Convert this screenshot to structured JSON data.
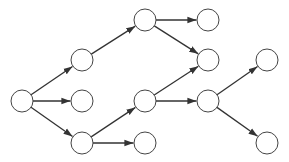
{
  "diagram": {
    "type": "directed-tree-graph",
    "node_radius": 11,
    "colors": {
      "node_fill": "#ffffff",
      "node_stroke": "#444444",
      "edge": "#333333",
      "background": "#ffffff"
    },
    "nodes": [
      {
        "id": "A",
        "x": 22,
        "y": 101
      },
      {
        "id": "B",
        "x": 82,
        "y": 60
      },
      {
        "id": "C",
        "x": 82,
        "y": 101
      },
      {
        "id": "D",
        "x": 82,
        "y": 143
      },
      {
        "id": "E",
        "x": 145,
        "y": 20
      },
      {
        "id": "F",
        "x": 208,
        "y": 20
      },
      {
        "id": "G",
        "x": 208,
        "y": 60
      },
      {
        "id": "H",
        "x": 145,
        "y": 101
      },
      {
        "id": "I",
        "x": 145,
        "y": 143
      },
      {
        "id": "J",
        "x": 208,
        "y": 101
      },
      {
        "id": "K",
        "x": 267,
        "y": 60
      },
      {
        "id": "L",
        "x": 267,
        "y": 143
      }
    ],
    "edges": [
      {
        "from": "A",
        "to": "B"
      },
      {
        "from": "A",
        "to": "C"
      },
      {
        "from": "A",
        "to": "D"
      },
      {
        "from": "B",
        "to": "E"
      },
      {
        "from": "E",
        "to": "F"
      },
      {
        "from": "E",
        "to": "G"
      },
      {
        "from": "D",
        "to": "H"
      },
      {
        "from": "D",
        "to": "I"
      },
      {
        "from": "H",
        "to": "G"
      },
      {
        "from": "H",
        "to": "J"
      },
      {
        "from": "J",
        "to": "K"
      },
      {
        "from": "J",
        "to": "L"
      }
    ]
  }
}
